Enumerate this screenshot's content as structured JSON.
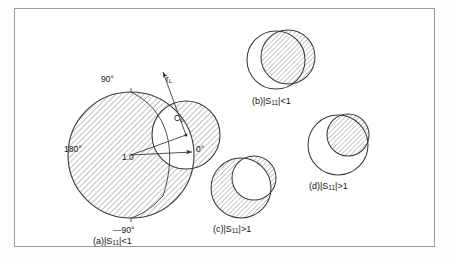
{
  "figure": {
    "border_color": "#9a9a9a",
    "line_color": "#3a3a3a",
    "hatch_color": "#8a8a8a",
    "background": "#ffffff"
  },
  "panels": [
    {
      "id": "a",
      "caption_prefix": "(a)",
      "caption_mid": "|S",
      "caption_sub": "11",
      "caption_suffix": "|<1",
      "caption_full": "(a)|S11|<1",
      "description": "Large unit Smith chart with load stability circle; stable region is interior of unit circle outside stability circle"
    },
    {
      "id": "b",
      "caption_prefix": "(b)",
      "caption_mid": "|S",
      "caption_sub": "11",
      "caption_suffix": "|<1",
      "caption_full": "(b) |S11|<1",
      "description": "Stability circle overlaps unit circle; hatched region is inside stability circle"
    },
    {
      "id": "c",
      "caption_prefix": "(c)",
      "caption_mid": "|S",
      "caption_sub": "11",
      "caption_suffix": "|>1",
      "caption_full": "(c)|S11|>1",
      "description": "Stability circle inside unit circle; hatched region is unit circle minus stability circle"
    },
    {
      "id": "d",
      "caption_prefix": "(d)",
      "caption_mid": "|S",
      "caption_sub": "11",
      "caption_suffix": "|>1",
      "caption_full": "(d) |S11|>1",
      "description": "Small stability circle fully inside unit circle; hatched region is the stability circle interior"
    }
  ],
  "angle_labels": {
    "deg_90": "90°",
    "deg_180": "180°",
    "deg_0": "0°",
    "deg_minus_90": "—90°"
  },
  "chart_labels": {
    "unit_radius": "1.0",
    "center_symbol": "C",
    "center_subscript": "L",
    "radius_symbol": "r",
    "radius_subscript": "L"
  }
}
